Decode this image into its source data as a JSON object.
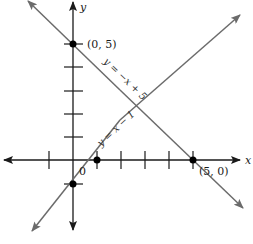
{
  "diagram": {
    "type": "coordinate-plane-two-lines",
    "axes": {
      "x_label": "x",
      "y_label": "y",
      "origin_label": "0"
    },
    "lines": [
      {
        "equation": "y = −x + 5",
        "slope": -1,
        "intercept": 5,
        "color": "#6b6b6b"
      },
      {
        "equation": "y = x − 1",
        "slope": 1,
        "intercept": -1,
        "color": "#6b6b6b"
      }
    ],
    "points": [
      {
        "label": "(0, 5)",
        "x": 0,
        "y": 5
      },
      {
        "label": "(5, 0)",
        "x": 5,
        "y": 0
      },
      {
        "label": "",
        "x": 1,
        "y": 0
      },
      {
        "label": "",
        "x": 0,
        "y": -1
      }
    ],
    "x_ticks": [
      -1,
      1,
      2,
      3,
      4,
      5
    ],
    "y_ticks": [
      -1,
      1,
      2,
      3,
      4,
      5
    ],
    "colors": {
      "axis": "#1a1a1a",
      "line": "#6b6b6b",
      "point": "#000000"
    }
  }
}
